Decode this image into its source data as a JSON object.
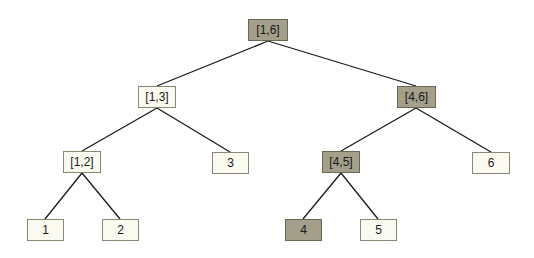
{
  "colors": {
    "highlight_fill": "#a39f8a",
    "plain_fill": "#fbfaf1",
    "edge": "#1a1a1a"
  },
  "nodes": [
    {
      "id": "r",
      "label": "[1,6]",
      "highlighted": true,
      "x": 248,
      "y": 19,
      "w": 40
    },
    {
      "id": "n13",
      "label": "[1,3]",
      "highlighted": false,
      "x": 138,
      "y": 86,
      "w": 38
    },
    {
      "id": "n46",
      "label": "[4,6]",
      "highlighted": true,
      "x": 397,
      "y": 86,
      "w": 39
    },
    {
      "id": "n12",
      "label": "[1,2]",
      "highlighted": false,
      "x": 63,
      "y": 151,
      "w": 38
    },
    {
      "id": "n3",
      "label": "3",
      "highlighted": false,
      "x": 212,
      "y": 152,
      "w": 37
    },
    {
      "id": "n45",
      "label": "[4,5]",
      "highlighted": true,
      "x": 322,
      "y": 151,
      "w": 38
    },
    {
      "id": "n6",
      "label": "6",
      "highlighted": false,
      "x": 472,
      "y": 152,
      "w": 38
    },
    {
      "id": "n1",
      "label": "1",
      "highlighted": false,
      "x": 27,
      "y": 219,
      "w": 37
    },
    {
      "id": "n2",
      "label": "2",
      "highlighted": false,
      "x": 102,
      "y": 219,
      "w": 37
    },
    {
      "id": "n4",
      "label": "4",
      "highlighted": true,
      "x": 285,
      "y": 219,
      "w": 37
    },
    {
      "id": "n5",
      "label": "5",
      "highlighted": false,
      "x": 360,
      "y": 219,
      "w": 37
    }
  ],
  "edges": [
    [
      "r",
      "n13"
    ],
    [
      "r",
      "n46"
    ],
    [
      "n13",
      "n12"
    ],
    [
      "n13",
      "n3"
    ],
    [
      "n46",
      "n45"
    ],
    [
      "n46",
      "n6"
    ],
    [
      "n12",
      "n1"
    ],
    [
      "n12",
      "n2"
    ],
    [
      "n45",
      "n4"
    ],
    [
      "n45",
      "n5"
    ]
  ]
}
